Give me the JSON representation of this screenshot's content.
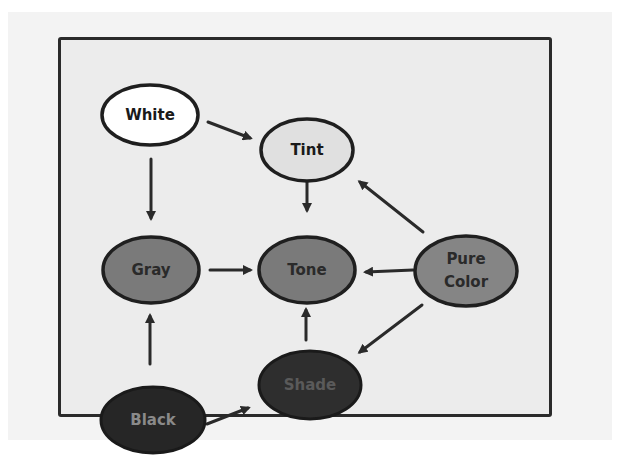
{
  "diagram": {
    "type": "hand-drawn concept graph",
    "nodes": [
      {
        "id": "white",
        "label": "White",
        "fill": "#ffffff",
        "text_color": "#1a1a1a"
      },
      {
        "id": "tint",
        "label": "Tint",
        "fill": "#e0e0e0",
        "text_color": "#1a1a1a"
      },
      {
        "id": "gray",
        "label": "Gray",
        "fill": "#7a7a7a",
        "text_color": "#2a2a2a"
      },
      {
        "id": "tone",
        "label": "Tone",
        "fill": "#7a7a7a",
        "text_color": "#2a2a2a"
      },
      {
        "id": "pure_color",
        "label_line1": "Pure",
        "label_line2": "Color",
        "fill": "#858585",
        "text_color": "#2a2a2a"
      },
      {
        "id": "black",
        "label": "Black",
        "fill": "#262626",
        "text_color": "#8a8a8a"
      },
      {
        "id": "shade",
        "label": "Shade",
        "fill": "#2e2e2e",
        "text_color": "#5a5a5a"
      }
    ],
    "edges": [
      {
        "from": "White",
        "to": "Tint"
      },
      {
        "from": "White",
        "to": "Gray"
      },
      {
        "from": "Tint",
        "to": "Tone"
      },
      {
        "from": "Gray",
        "to": "Tone"
      },
      {
        "from": "Pure Color",
        "to": "Tint"
      },
      {
        "from": "Pure Color",
        "to": "Tone"
      },
      {
        "from": "Pure Color",
        "to": "Shade"
      },
      {
        "from": "Black",
        "to": "Gray"
      },
      {
        "from": "Black",
        "to": "Shade"
      },
      {
        "from": "Shade",
        "to": "Tone"
      }
    ]
  }
}
